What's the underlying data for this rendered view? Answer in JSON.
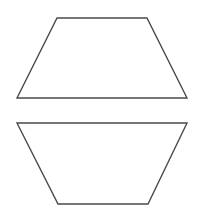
{
  "canvas": {
    "width": 205,
    "height": 213,
    "background": "#ffffff"
  },
  "stroke_color": "#4a4a4a",
  "shapes": [
    {
      "name": "upper-trapezoid",
      "type": "trapezoid",
      "orientation": "narrow-top",
      "points": "57,18 147,18 187,98 17,98"
    },
    {
      "name": "lower-trapezoid",
      "type": "trapezoid",
      "orientation": "narrow-bottom",
      "points": "17,123 187,123 148,204 58,204"
    }
  ]
}
